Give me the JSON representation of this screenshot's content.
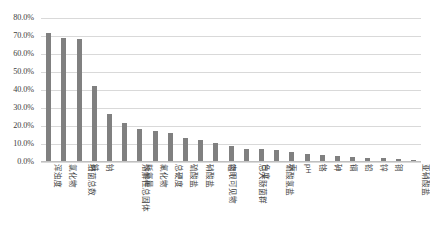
{
  "chart_data": {
    "type": "bar",
    "title": "",
    "xlabel": "",
    "ylabel": "",
    "ylim": [
      0,
      80
    ],
    "grid": true,
    "legend": "none",
    "series_color": "#808080",
    "ytick_labels": [
      "80.0%",
      "70.0%",
      "60.0%",
      "50.0%",
      "40.0%",
      "30.0%",
      "20.0%",
      "10.0%",
      "0.0%"
    ],
    "ytick_values": [
      80,
      70,
      60,
      50,
      40,
      30,
      20,
      10,
      0
    ],
    "categories": [
      "浑浊度",
      "氯化物",
      "细菌总数",
      "铁",
      "钠",
      "溶解性总固体",
      "耗氧量",
      "氟化物",
      "总硬度",
      "硫酸盐",
      "硝酸盐",
      "肉眼可见物",
      "锰",
      "总大肠菌群",
      "色度",
      "硫酸氢盐",
      "汞",
      "pH",
      "铬",
      "砷",
      "镉",
      "铅",
      "锌",
      "铜",
      "亚硝酸盐"
    ],
    "values": [
      71.5,
      69.0,
      68.5,
      42.0,
      26.5,
      21.5,
      18.5,
      17.5,
      16.0,
      13.5,
      12.5,
      10.5,
      9.0,
      7.5,
      7.0,
      6.5,
      5.5,
      4.5,
      4.0,
      3.5,
      3.0,
      2.5,
      2.0,
      1.5,
      1.0
    ]
  }
}
